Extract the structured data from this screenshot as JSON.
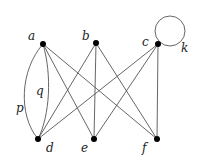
{
  "graph": {
    "nodes": [
      {
        "id": "a",
        "label": "a",
        "x": 43,
        "y": 44,
        "lx": 30,
        "ly": 38
      },
      {
        "id": "b",
        "label": "b",
        "x": 96,
        "y": 43,
        "lx": 82,
        "ly": 38
      },
      {
        "id": "c",
        "label": "c",
        "x": 158,
        "y": 44,
        "lx": 142,
        "ly": 44
      },
      {
        "id": "d",
        "label": "d",
        "x": 38,
        "y": 139,
        "lx": 47,
        "ly": 152
      },
      {
        "id": "e",
        "label": "e",
        "x": 94,
        "y": 139,
        "lx": 81,
        "ly": 152
      },
      {
        "id": "f",
        "label": "f",
        "x": 157,
        "y": 139,
        "lx": 141,
        "ly": 152
      }
    ],
    "edge_labels": {
      "p": "p",
      "q": "q",
      "k": "k"
    },
    "edges": [
      {
        "from": "a",
        "to": "d",
        "name": "p",
        "curve": "left"
      },
      {
        "from": "a",
        "to": "d",
        "name": "q",
        "curve": "right"
      },
      {
        "from": "a",
        "to": "e"
      },
      {
        "from": "a",
        "to": "f"
      },
      {
        "from": "b",
        "to": "d"
      },
      {
        "from": "b",
        "to": "e"
      },
      {
        "from": "b",
        "to": "f"
      },
      {
        "from": "c",
        "to": "d"
      },
      {
        "from": "c",
        "to": "e"
      },
      {
        "from": "c",
        "to": "f"
      },
      {
        "from": "c",
        "to": "c",
        "name": "k",
        "loop": true
      }
    ]
  }
}
